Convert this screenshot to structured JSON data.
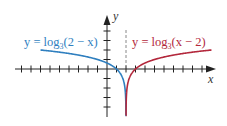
{
  "chart_data": {
    "type": "line",
    "title": "",
    "xlabel": "x",
    "ylabel": "y",
    "xlim": [
      -9.5,
      11.2
    ],
    "ylim": [
      -5,
      5.5
    ],
    "x_ticks": [
      -9,
      -8,
      -7,
      -6,
      -5,
      -4,
      -3,
      -2,
      -1,
      1,
      2,
      3,
      4,
      5,
      6,
      7,
      8,
      9,
      10
    ],
    "y_ticks": [
      -4,
      -3,
      -2,
      -1,
      1,
      2,
      3,
      4
    ],
    "grid": false,
    "asymptote": {
      "x": 2,
      "style": "dashed"
    },
    "series": [
      {
        "name": "y = log3(2 − x)",
        "function": "log3(2 - x)",
        "domain": [
          -7,
          1.99
        ],
        "color": "#2f7fbf",
        "points": [
          [
            -7,
            2
          ],
          [
            -4,
            1.63
          ],
          [
            -1,
            1
          ],
          [
            1,
            0
          ],
          [
            1.67,
            -1
          ],
          [
            1.89,
            -2
          ],
          [
            1.96,
            -3
          ],
          [
            1.99,
            -4.2
          ]
        ]
      },
      {
        "name": "y = log3(x − 2)",
        "function": "log3(x - 2)",
        "domain": [
          2.01,
          11
        ],
        "color": "#b3283c",
        "points": [
          [
            2.01,
            -4.2
          ],
          [
            2.04,
            -3
          ],
          [
            2.11,
            -2
          ],
          [
            2.33,
            -1
          ],
          [
            3,
            0
          ],
          [
            5,
            1
          ],
          [
            8,
            1.63
          ],
          [
            11,
            2
          ]
        ]
      }
    ],
    "annotations": [
      {
        "text_prefix": "y = log",
        "subscript": "3",
        "text_suffix": "(2 − x)",
        "color": "#2f7fbf"
      },
      {
        "text_prefix": "y = log",
        "subscript": "3",
        "text_suffix": "(x − 2)",
        "color": "#b3283c"
      }
    ]
  },
  "labels": {
    "x_axis": "x",
    "y_axis": "y",
    "left_eq_prefix": "y = log",
    "left_eq_sub": "3",
    "left_eq_suffix": "(2 − x)",
    "right_eq_prefix": "y = log",
    "right_eq_sub": "3",
    "right_eq_suffix": "(x − 2)"
  }
}
